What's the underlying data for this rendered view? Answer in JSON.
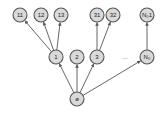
{
  "diagram": {
    "type": "tree",
    "nodes": [
      {
        "id": "root",
        "label": "ø",
        "x": 77,
        "y": 99
      },
      {
        "id": "n1",
        "label": "1",
        "x": 56,
        "y": 57
      },
      {
        "id": "n2",
        "label": "2",
        "x": 77,
        "y": 57
      },
      {
        "id": "n3",
        "label": "3",
        "x": 97,
        "y": 57
      },
      {
        "id": "nN",
        "label": "N₀",
        "x": 147,
        "y": 57
      },
      {
        "id": "n11",
        "label": "11",
        "x": 20,
        "y": 15
      },
      {
        "id": "n12",
        "label": "12",
        "x": 41,
        "y": 15
      },
      {
        "id": "n13",
        "label": "13",
        "x": 61,
        "y": 15
      },
      {
        "id": "n31",
        "label": "31",
        "x": 97,
        "y": 15
      },
      {
        "id": "n32",
        "label": "32",
        "x": 113,
        "y": 15
      },
      {
        "id": "nN1",
        "label": "N₀1",
        "x": 147,
        "y": 15
      }
    ],
    "edges": [
      [
        "root",
        "n1"
      ],
      [
        "root",
        "n2"
      ],
      [
        "root",
        "n3"
      ],
      [
        "root",
        "nN"
      ],
      [
        "n1",
        "n11"
      ],
      [
        "n1",
        "n12"
      ],
      [
        "n1",
        "n13"
      ],
      [
        "n3",
        "n31"
      ],
      [
        "n3",
        "n32"
      ],
      [
        "nN",
        "nN1"
      ]
    ],
    "ellipsis": {
      "label": "...",
      "x": 125,
      "y": 59
    },
    "colors": {
      "node_fill": "#d9d9d9",
      "node_stroke": "#555555",
      "edge": "#555555"
    }
  }
}
